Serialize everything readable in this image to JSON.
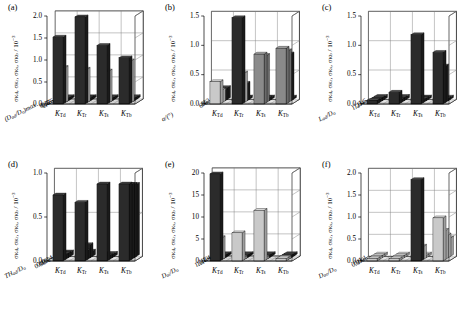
{
  "figure": {
    "panel_count": 6,
    "x_categories": [
      "K_Td",
      "K_Tr",
      "K_Ts",
      "K_Tb"
    ],
    "x_labels": [
      {
        "base": "K",
        "sub": "Td"
      },
      {
        "base": "K",
        "sub": "Tr"
      },
      {
        "base": "K",
        "sub": "Ts"
      },
      {
        "base": "K",
        "sub": "Tb"
      }
    ]
  },
  "chart_data": [
    {
      "id": "a",
      "type": "bar",
      "label": "(a)",
      "title": "",
      "ylabel": "σKd, σKr, σKs, σKb / 10-3",
      "ylabel_parts": {
        "pre": "σ",
        "subs": [
          "Kd",
          "Kr",
          "Ks",
          "Kb"
        ],
        "div": "/ 10",
        "sup": "−3"
      },
      "zlabel": "(Dad/Do)max",
      "zlabel_text": "(D",
      "zlabel_sub1": "ad",
      "zlabel_mid": "/D",
      "zlabel_sub2": "o",
      "zlabel_sup": "max",
      "ylim": [
        0.0,
        2.0
      ],
      "yticks": [
        "0.0",
        "0.5",
        "1.0",
        "1.5",
        "2.0"
      ],
      "zticks": [
        "2",
        "1",
        "0.5",
        "0.25",
        "0.125"
      ],
      "categories": [
        "K_Td",
        "K_Tr",
        "K_Ts",
        "K_Tb"
      ],
      "series": [
        {
          "name": "0.125",
          "values": [
            1.52,
            1.98,
            1.33,
            1.05
          ],
          "shade": "dark"
        },
        {
          "name": "0.25",
          "values": [
            0.8,
            0.76,
            0.72,
            0.95
          ],
          "shade": "light"
        },
        {
          "name": "0.5",
          "values": [
            0.04,
            0.06,
            0.04,
            0.03
          ],
          "shade": "dark"
        },
        {
          "name": "1",
          "values": [
            0.04,
            0.06,
            0.04,
            0.03
          ],
          "shade": "dark"
        },
        {
          "name": "2",
          "values": [
            0.04,
            0.05,
            0.04,
            0.03
          ],
          "shade": "dark"
        }
      ]
    },
    {
      "id": "b",
      "type": "bar",
      "label": "(b)",
      "ylabel": "σKd, σKr, σKs, σKb / 10-3",
      "ylabel_parts": {
        "pre": "σ",
        "subs": [
          "Kd",
          "Kr",
          "Ks",
          "Kb"
        ],
        "div": "/ 10",
        "sup": "−3"
      },
      "zlabel": "alpha/(deg)",
      "zlabel_text": "α",
      "zlabel_mid": "/(°)",
      "ylim": [
        0.0,
        1.5
      ],
      "yticks": [
        "0.0",
        "0.5",
        "1.0",
        "1.5"
      ],
      "zticks": [
        "6",
        "8",
        "10",
        "12"
      ],
      "categories": [
        "K_Td",
        "K_Tr",
        "K_Ts",
        "K_Tb"
      ],
      "series": [
        {
          "name": "12",
          "values": [
            0.38,
            1.47,
            0.85,
            0.95
          ],
          "shade": "mixed"
        },
        {
          "name": "10",
          "values": [
            0.22,
            0.5,
            0.8,
            0.88
          ],
          "shade": "mixed"
        },
        {
          "name": "8",
          "values": [
            0.18,
            0.3,
            0.05,
            0.8
          ],
          "shade": "dark"
        },
        {
          "name": "6",
          "values": [
            0.2,
            0.04,
            0.04,
            0.03
          ],
          "shade": "dark"
        }
      ]
    },
    {
      "id": "c",
      "type": "bar",
      "label": "(c)",
      "ylabel": "σKd, σKr, σKs, σKb / 10-3",
      "ylabel_parts": {
        "pre": "σ",
        "subs": [
          "Kd",
          "Kr",
          "Ks",
          "Kb"
        ],
        "div": "/ 10",
        "sup": "−3"
      },
      "zlabel": "Lad/Do",
      "zlabel_text": "L",
      "zlabel_sub1": "ad",
      "zlabel_mid": "/D",
      "zlabel_sub2": "o",
      "ylim": [
        0.0,
        1.5
      ],
      "yticks": [
        "0.0",
        "0.5",
        "1.0",
        "1.5"
      ],
      "zticks": [
        "1.2",
        "1.3",
        "1.4",
        "1.5"
      ],
      "categories": [
        "K_Td",
        "K_Tr",
        "K_Ts",
        "K_Tb"
      ],
      "series": [
        {
          "name": "1.2",
          "values": [
            0.06,
            0.2,
            1.18,
            0.88
          ],
          "shade": "dark"
        },
        {
          "name": "1.3",
          "values": [
            0.05,
            0.05,
            0.04,
            0.62
          ],
          "shade": "dark"
        },
        {
          "name": "1.4",
          "values": [
            0.05,
            0.05,
            0.04,
            0.03
          ],
          "shade": "dark"
        },
        {
          "name": "1.5",
          "values": [
            0.05,
            0.05,
            0.04,
            0.03
          ],
          "shade": "dark"
        }
      ]
    },
    {
      "id": "d",
      "type": "bar",
      "label": "(d)",
      "ylabel": "σKd, σKr, σKs, σKb / 10-3",
      "ylabel_parts": {
        "pre": "σ",
        "subs": [
          "Kd",
          "Kr",
          "Ks",
          "Kb"
        ],
        "div": "/ 10",
        "sup": "−3"
      },
      "zlabel": "THad/Do",
      "zlabel_text": "TH",
      "zlabel_sub1": "ad",
      "zlabel_mid": "/D",
      "zlabel_sub2": "o",
      "ylim": [
        0.0,
        1.2
      ],
      "yticks": [
        "0.0",
        "0.5",
        "1.0"
      ],
      "zticks": [
        "0.08",
        "0.10",
        "0.12",
        "0.14"
      ],
      "categories": [
        "K_Td",
        "K_Tr",
        "K_Ts",
        "K_Tb"
      ],
      "series": [
        {
          "name": "0.08",
          "values": [
            0.9,
            0.8,
            1.05,
            1.05
          ],
          "shade": "dark"
        },
        {
          "name": "0.10",
          "values": [
            0.06,
            0.12,
            0.05,
            1.02
          ],
          "shade": "dark"
        },
        {
          "name": "0.12",
          "values": [
            0.06,
            0.18,
            0.04,
            1.0
          ],
          "shade": "dark"
        },
        {
          "name": "0.14",
          "values": [
            0.06,
            0.07,
            0.04,
            0.98
          ],
          "shade": "dark"
        }
      ]
    },
    {
      "id": "e",
      "type": "bar",
      "label": "(e)",
      "ylabel": "σKd, σKr, σKs, σKb / 10-3",
      "ylabel_parts": {
        "pre": "σ",
        "subs": [
          "Kd",
          "Kr",
          "Ks",
          "Kb"
        ],
        "div": "/ 10",
        "sup": "−3"
      },
      "zlabel": "Dai/Do",
      "zlabel_text": "D",
      "zlabel_sub1": "ai",
      "zlabel_mid": "/D",
      "zlabel_sub2": "o",
      "ylim": [
        0,
        20
      ],
      "yticks": [
        "0",
        "5",
        "10",
        "15",
        "20"
      ],
      "zticks": [
        "1.0",
        "1.1",
        "1.2",
        "1.3",
        "1.4"
      ],
      "categories": [
        "K_Td",
        "K_Tr",
        "K_Ts",
        "K_Tb"
      ],
      "series": [
        {
          "name": "1.4",
          "values": [
            19.8,
            6.4,
            11.5,
            0.4
          ],
          "shade": "mixed"
        },
        {
          "name": "1.3",
          "values": [
            5.0,
            0.4,
            0.4,
            0.4
          ],
          "shade": "light"
        },
        {
          "name": "1.2",
          "values": [
            0.4,
            0.4,
            0.4,
            0.4
          ],
          "shade": "dark"
        },
        {
          "name": "1.1",
          "values": [
            0.4,
            0.4,
            0.4,
            0.4
          ],
          "shade": "dark"
        },
        {
          "name": "1.0",
          "values": [
            0.4,
            0.4,
            0.4,
            0.4
          ],
          "shade": "dark"
        }
      ]
    },
    {
      "id": "f",
      "type": "bar",
      "label": "(f)",
      "ylabel": "σKd, σKr, σKs, σKb / 10-3",
      "ylabel_parts": {
        "pre": "σ",
        "subs": [
          "Kd",
          "Kr",
          "Ks",
          "Kb"
        ],
        "div": "/ 10",
        "sup": "−3"
      },
      "zlabel": "Dao/Do",
      "zlabel_text": "D",
      "zlabel_sub1": "ao",
      "zlabel_mid": "/D",
      "zlabel_sub2": "o",
      "ylim": [
        0.0,
        2.0
      ],
      "yticks": [
        "0.0",
        "0.5",
        "1.0",
        "1.5",
        "2.0"
      ],
      "zticks": [
        "0.8",
        "0.9",
        "1.0",
        "1.1"
      ],
      "categories": [
        "K_Td",
        "K_Tr",
        "K_Ts",
        "K_Tb"
      ],
      "series": [
        {
          "name": "1.1",
          "values": [
            0.05,
            0.05,
            1.85,
            0.98
          ],
          "shade": "mixed"
        },
        {
          "name": "1.0",
          "values": [
            0.05,
            0.05,
            0.3,
            0.66
          ],
          "shade": "mixed"
        },
        {
          "name": "0.9",
          "values": [
            0.05,
            0.05,
            0.05,
            0.52
          ],
          "shade": "light"
        },
        {
          "name": "0.8",
          "values": [
            0.05,
            0.05,
            0.05,
            0.42
          ],
          "shade": "light"
        }
      ]
    }
  ],
  "colors": {
    "dark_front": "#2b2b2b",
    "dark_side": "#1a1a1a",
    "dark_top": "#4a4a4a",
    "light_front": "#c9c9c9",
    "light_side": "#9e9e9e",
    "light_top": "#dedede",
    "mid_front": "#8a8a8a",
    "mid_side": "#6a6a6a",
    "mid_top": "#a8a8a8",
    "axis": "#000000",
    "grid": "#7a7a7a",
    "floor": "#ffffff"
  }
}
